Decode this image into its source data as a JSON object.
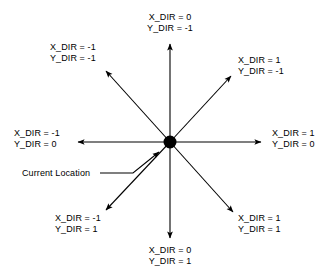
{
  "diagram": {
    "center_label": "Current Location",
    "colors": {
      "background": "#ffffff",
      "line": "#000000",
      "text": "#000000",
      "center_dot": "#000000"
    },
    "center_point": {
      "x": 170,
      "y": 142
    },
    "directions": [
      {
        "id": "north",
        "name": "up",
        "x_dir": "X_DIR = 0",
        "y_dir": "Y_DIR = -1",
        "label_x": 170,
        "label_y": 12,
        "anchor": "center",
        "tip": {
          "x": 170,
          "y": 42
        }
      },
      {
        "id": "northwest",
        "name": "up-left",
        "x_dir": "X_DIR = -1",
        "y_dir": "Y_DIR = -1",
        "label_x": 50,
        "label_y": 42,
        "anchor": "left",
        "tip": {
          "x": 103,
          "y": 68
        }
      },
      {
        "id": "northeast",
        "name": "up-right",
        "x_dir": "X_DIR = 1",
        "y_dir": "Y_DIR = -1",
        "label_x": 238,
        "label_y": 55,
        "anchor": "left",
        "tip": {
          "x": 234,
          "y": 73
        }
      },
      {
        "id": "west",
        "name": "left",
        "x_dir": "X_DIR = -1",
        "y_dir": "Y_DIR = 0",
        "label_x": 14,
        "label_y": 128,
        "anchor": "left",
        "tip": {
          "x": 75,
          "y": 142
        }
      },
      {
        "id": "east",
        "name": "right",
        "x_dir": "X_DIR = 1",
        "y_dir": "Y_DIR = 0",
        "label_x": 272,
        "label_y": 128,
        "anchor": "left",
        "tip": {
          "x": 264,
          "y": 142
        }
      },
      {
        "id": "southwest",
        "name": "down-left",
        "x_dir": "X_DIR = -1",
        "y_dir": "Y_DIR = 1",
        "label_x": 55,
        "label_y": 213,
        "anchor": "left",
        "tip": {
          "x": 103,
          "y": 213
        }
      },
      {
        "id": "southeast",
        "name": "down-right",
        "x_dir": "X_DIR = 1",
        "y_dir": "Y_DIR = 1",
        "label_x": 238,
        "label_y": 213,
        "anchor": "left",
        "tip": {
          "x": 236,
          "y": 215
        }
      },
      {
        "id": "south",
        "name": "down",
        "x_dir": "X_DIR = 0",
        "y_dir": "Y_DIR = 1",
        "label_x": 170,
        "label_y": 245,
        "anchor": "center",
        "tip": {
          "x": 170,
          "y": 240
        }
      }
    ],
    "annotation": {
      "text": "Current Location",
      "label_x": 22,
      "label_y": 168,
      "leader_from": {
        "x": 118,
        "y": 173
      },
      "leader_elbow": {
        "x": 133,
        "y": 173
      },
      "leader_to": {
        "x": 162,
        "y": 150
      }
    }
  }
}
